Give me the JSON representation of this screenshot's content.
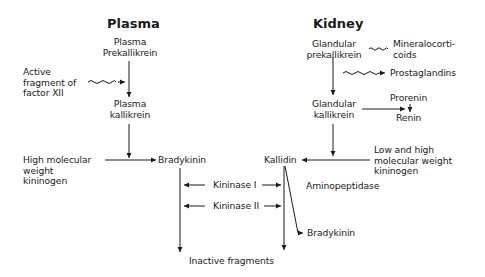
{
  "plasma": {
    "title": "Plasma",
    "prekallikrein": "Plasma\nPrekallikrein",
    "activator": "Active\nfragment of\nfactor XII",
    "kallikrein": "Plasma\nkallikrein",
    "kininogen": "High molecular\nweight\nkininogen",
    "product": "Bradykinin"
  },
  "kidney": {
    "title": "Kidney",
    "prekallikrein": "Glandular\nprekallikrein",
    "mineralocorticoids": "Mineralocorti-\ncoids",
    "prostaglandins": "Prostaglandins",
    "kallikrein": "Glandular\nkallikrein",
    "prorenin": "Prorenin",
    "renin": "Renin",
    "kininogen": "Low and high\nmolecular weight\nkininogen",
    "product": "Kallidin",
    "aminopeptidase": "Aminopeptidase",
    "bradykinin": "Bradykinin"
  },
  "shared": {
    "kininase1": "Kininase I",
    "kininase2": "Kininase II",
    "inactive": "Inactive fragments"
  },
  "colors": {
    "ink": "#1a1a1a",
    "background": "#ffffff"
  }
}
